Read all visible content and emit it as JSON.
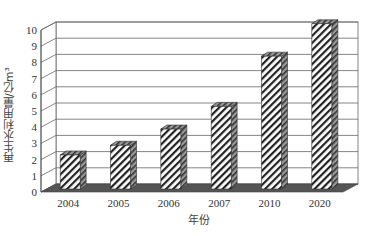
{
  "chart_data": {
    "type": "bar",
    "style": "3d-column-hatched",
    "title": "",
    "xlabel": "年份",
    "ylabel": "再生水利用量/亿m³",
    "categories": [
      "2004",
      "2005",
      "2006",
      "2007",
      "2010",
      "2020"
    ],
    "values": [
      2.1,
      2.7,
      3.7,
      5.1,
      8.2,
      10.2
    ],
    "ylim": [
      0,
      10
    ],
    "yticks": [
      "0",
      "1",
      "2",
      "3",
      "4",
      "5",
      "6",
      "7",
      "8",
      "9",
      "10"
    ],
    "grid": true,
    "legend": null,
    "colors": {
      "bar_fill": "#ffffff",
      "hatch": "#222222",
      "bar_side": "#555555",
      "floor": "#555555",
      "grid": "#666666"
    }
  }
}
